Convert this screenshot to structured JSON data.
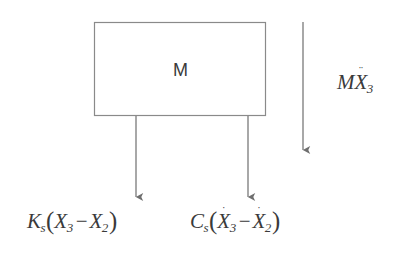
{
  "diagram": {
    "type": "free-body-diagram",
    "background_color": "#ffffff",
    "stroke_color": "#808080",
    "text_color": "#3a3a3a",
    "width": 405,
    "height": 253,
    "body": {
      "label": "M",
      "shape": "rectangle",
      "x": 94,
      "y": 22,
      "width": 172,
      "height": 94
    },
    "forces": [
      {
        "name": "spring-force",
        "label_parts": {
          "coefficient": "K",
          "coefficient_sub": "s",
          "open": "(",
          "term1": "X",
          "term1_sub": "3",
          "term1_accent": "",
          "operator": "−",
          "term2": "X",
          "term2_sub": "2",
          "term2_accent": "",
          "close": ")"
        },
        "label_text": "Ks(X3 − X2)",
        "direction": "down",
        "arrow_x": 136,
        "arrow_y1": 116,
        "arrow_y2": 200
      },
      {
        "name": "damper-force",
        "label_parts": {
          "coefficient": "C",
          "coefficient_sub": "s",
          "open": "(",
          "term1": "X",
          "term1_sub": "3",
          "term1_accent": "˙",
          "operator": "−",
          "term2": "X",
          "term2_sub": "2",
          "term2_accent": "˙",
          "close": ")"
        },
        "label_text": "Cs(Ẋ3 − Ẋ2)",
        "direction": "down",
        "arrow_x": 248,
        "arrow_y1": 116,
        "arrow_y2": 200
      },
      {
        "name": "inertial-force",
        "label_parts": {
          "coefficient": "M",
          "coefficient_sub": "",
          "open": "",
          "term1": "X",
          "term1_sub": "3",
          "term1_accent": "¨",
          "operator": "",
          "term2": "",
          "term2_sub": "",
          "term2_accent": "",
          "close": ""
        },
        "label_text": "MX¨3",
        "direction": "down",
        "arrow_x": 303,
        "arrow_y1": 22,
        "arrow_y2": 153
      }
    ]
  },
  "labels": {
    "mass": "M",
    "spring": {
      "coef": "K",
      "coef_sub": "s",
      "open": "(",
      "x1": "X",
      "x1_sub": "3",
      "x1_dots": "",
      "minus": "−",
      "x2": "X",
      "x2_sub": "2",
      "x2_dots": "",
      "close": ")"
    },
    "damper": {
      "coef": "C",
      "coef_sub": "s",
      "open": "(",
      "x1": "X",
      "x1_sub": "3",
      "x1_dots": "˙",
      "minus": "−",
      "x2": "X",
      "x2_sub": "2",
      "x2_dots": "˙",
      "close": ")"
    },
    "inertia": {
      "coef": "M",
      "x1": "X",
      "x1_sub": "3",
      "x1_dots": "¨"
    }
  }
}
